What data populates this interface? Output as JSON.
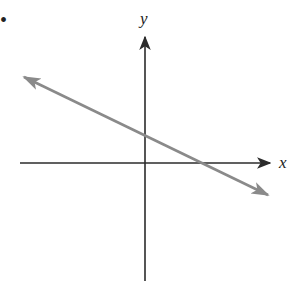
{
  "diagram": {
    "type": "coordinate-plane-line",
    "bullet": "•",
    "axes": {
      "x_label": "x",
      "y_label": "y",
      "axis_color": "#2b2b2b"
    },
    "line": {
      "description": "straight line with negative slope, positive y-intercept, positive x-intercept, arrows at both ends",
      "color": "#8a8a8a",
      "slope_sign": "negative",
      "y_intercept_sign": "positive",
      "x_intercept_sign": "positive"
    }
  }
}
